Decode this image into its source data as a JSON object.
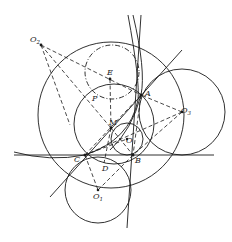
{
  "diagram": {
    "title": "",
    "colors": {
      "ink": "#1a1a1a",
      "background": "#ffffff"
    },
    "points": [
      {
        "id": "O2",
        "label": "O",
        "sub": "2",
        "x": 41,
        "y": 45,
        "lx": 30,
        "ly": 42
      },
      {
        "id": "E",
        "label": "E",
        "sub": "",
        "x": 110,
        "y": 79,
        "lx": 107,
        "ly": 75
      },
      {
        "id": "A",
        "label": "A",
        "sub": "",
        "x": 141,
        "y": 95,
        "lx": 145,
        "ly": 96
      },
      {
        "id": "P",
        "label": "P",
        "sub": "",
        "x": 100,
        "y": 103,
        "lx": 92,
        "ly": 101
      },
      {
        "id": "M",
        "label": "M",
        "sub": "",
        "x": 111,
        "y": 128,
        "lx": 109,
        "ly": 125
      },
      {
        "id": "O3",
        "label": "O",
        "sub": "3",
        "x": 182,
        "y": 112,
        "lx": 181,
        "ly": 113
      },
      {
        "id": "O",
        "label": "O",
        "sub": "",
        "x": 127,
        "y": 139,
        "lx": 126,
        "ly": 143
      },
      {
        "id": "C",
        "label": "C",
        "sub": "",
        "x": 85,
        "y": 155,
        "lx": 74,
        "ly": 162
      },
      {
        "id": "B",
        "label": "B",
        "sub": "",
        "x": 133,
        "y": 155,
        "lx": 135,
        "ly": 163
      },
      {
        "id": "D",
        "label": "D",
        "sub": "",
        "x": 104,
        "y": 163,
        "lx": 102,
        "ly": 171
      },
      {
        "id": "O1",
        "label": "O",
        "sub": "1",
        "x": 98,
        "y": 190,
        "lx": 93,
        "ly": 199
      }
    ],
    "labels": {
      "O2": "O",
      "O2_sub": "2",
      "E": "E",
      "A": "A",
      "P": "P",
      "M": "M",
      "O3": "O",
      "O3_sub": "3",
      "O": "O",
      "C": "C",
      "B": "B",
      "D": "D",
      "O1": "O",
      "O1_sub": "1"
    },
    "circles": [
      {
        "name": "large-circle",
        "cx": 111,
        "cy": 115,
        "r": 73,
        "style": "solid"
      },
      {
        "name": "circle-O3",
        "cx": 182,
        "cy": 112,
        "r": 43,
        "style": "solid"
      },
      {
        "name": "circle-O1",
        "cx": 98,
        "cy": 190,
        "r": 33,
        "style": "solid"
      },
      {
        "name": "incircle-O",
        "cx": 127,
        "cy": 139,
        "r": 16,
        "style": "solid"
      },
      {
        "name": "middle-circle",
        "cx": 114,
        "cy": 124,
        "r": 40,
        "style": "solid"
      },
      {
        "name": "dashdot-circle",
        "cx": 112,
        "cy": 72,
        "r": 27,
        "style": "dash-dot"
      }
    ],
    "lines": [
      {
        "name": "tangent-line-BC",
        "x1": 14,
        "y1": 155,
        "x2": 214,
        "y2": 155,
        "style": "solid"
      },
      {
        "name": "tangent-line-CA",
        "x1": 50,
        "y1": 197,
        "x2": 182,
        "y2": 50,
        "style": "solid"
      },
      {
        "name": "tangent-line-AB",
        "x1": 141,
        "y1": 15,
        "x2": 127,
        "y2": 228,
        "style": "solid"
      }
    ]
  }
}
